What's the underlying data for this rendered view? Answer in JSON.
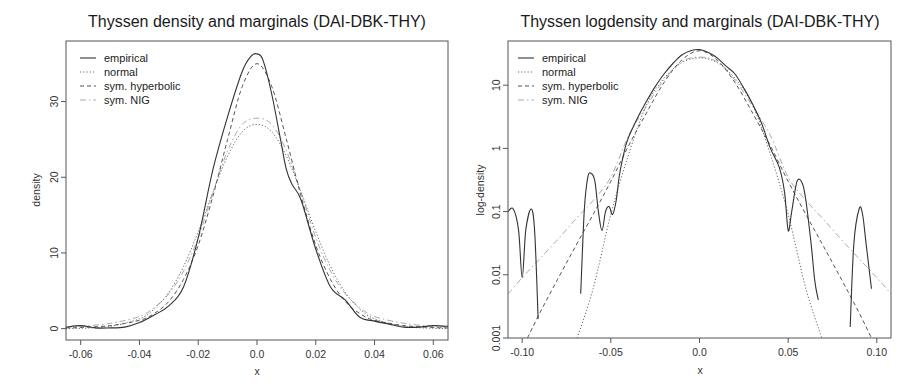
{
  "chart_data": [
    {
      "type": "line",
      "title": "Thyssen density and marginals (DAI-DBK-THY)",
      "xlabel": "x",
      "ylabel": "density",
      "xlim": [
        -0.065,
        0.065
      ],
      "ylim": [
        -1.5,
        38
      ],
      "yscale": "linear",
      "xticks": [
        -0.06,
        -0.04,
        -0.02,
        0.0,
        0.02,
        0.04,
        0.06
      ],
      "xtick_labels": [
        "-0.06",
        "-0.04",
        "-0.02",
        "0.0",
        "0.02",
        "0.04",
        "0.06"
      ],
      "yticks": [
        0,
        10,
        20,
        30
      ],
      "ytick_labels": [
        "0",
        "10",
        "20",
        "30"
      ],
      "legend": {
        "placement": "top-left",
        "entries": [
          "empirical",
          "normal",
          "sym. hyperbolic",
          "sym. NIG"
        ]
      },
      "series": [
        {
          "name": "empirical",
          "style": "solid",
          "color": "#333333",
          "x": [
            -0.065,
            -0.06,
            -0.055,
            -0.05,
            -0.045,
            -0.04,
            -0.035,
            -0.03,
            -0.025,
            -0.02,
            -0.015,
            -0.01,
            -0.005,
            -0.002,
            0.0,
            0.002,
            0.005,
            0.008,
            0.01,
            0.012,
            0.015,
            0.02,
            0.025,
            0.03,
            0.035,
            0.04,
            0.045,
            0.05,
            0.055,
            0.06,
            0.065
          ],
          "y": [
            0.2,
            0.4,
            0.1,
            0.1,
            0.2,
            0.8,
            1.8,
            3.0,
            5.5,
            12,
            21,
            28,
            34,
            36,
            36.3,
            35.5,
            31,
            25,
            21,
            19,
            17,
            10.5,
            5.5,
            3.8,
            1.5,
            1.0,
            0.6,
            0.2,
            0.2,
            0.4,
            0.3
          ]
        },
        {
          "name": "normal",
          "style": "dotted",
          "color": "#666666",
          "x": [
            -0.065,
            -0.06,
            -0.05,
            -0.04,
            -0.035,
            -0.03,
            -0.025,
            -0.02,
            -0.015,
            -0.01,
            -0.005,
            0.0,
            0.005,
            0.01,
            0.015,
            0.02,
            0.025,
            0.03,
            0.035,
            0.04,
            0.05,
            0.06,
            0.065
          ],
          "y": [
            0.02,
            0.05,
            0.3,
            1.3,
            2.6,
            4.8,
            8.2,
            12.8,
            18.0,
            22.8,
            26.0,
            27.0,
            26.0,
            22.8,
            18.0,
            12.8,
            8.2,
            4.8,
            2.6,
            1.3,
            0.3,
            0.05,
            0.02
          ]
        },
        {
          "name": "sym. hyperbolic",
          "style": "dashed",
          "color": "#555555",
          "x": [
            -0.065,
            -0.06,
            -0.05,
            -0.04,
            -0.035,
            -0.03,
            -0.025,
            -0.02,
            -0.015,
            -0.01,
            -0.005,
            0.0,
            0.005,
            0.01,
            0.015,
            0.02,
            0.025,
            0.03,
            0.035,
            0.04,
            0.05,
            0.06,
            0.065
          ],
          "y": [
            0.1,
            0.15,
            0.4,
            1.1,
            2.0,
            3.6,
            6.5,
            11.0,
            17.5,
            25.0,
            32.0,
            35.0,
            32.0,
            25.0,
            17.5,
            11.0,
            6.5,
            3.6,
            2.0,
            1.1,
            0.4,
            0.15,
            0.1
          ]
        },
        {
          "name": "sym. NIG",
          "style": "dashdot",
          "color": "#aaaaaa",
          "x": [
            -0.065,
            -0.06,
            -0.05,
            -0.04,
            -0.035,
            -0.03,
            -0.025,
            -0.02,
            -0.015,
            -0.01,
            -0.005,
            0.0,
            0.005,
            0.01,
            0.015,
            0.02,
            0.025,
            0.03,
            0.035,
            0.04,
            0.05,
            0.06,
            0.065
          ],
          "y": [
            0.2,
            0.3,
            0.7,
            1.6,
            2.8,
            4.6,
            7.6,
            12.0,
            18.0,
            23.5,
            27.0,
            27.8,
            27.0,
            23.5,
            18.0,
            12.0,
            7.6,
            4.6,
            2.8,
            1.6,
            0.7,
            0.3,
            0.2
          ]
        }
      ]
    },
    {
      "type": "line",
      "title": "Thyssen logdensity and marginals (DAI-DBK-THY)",
      "xlabel": "x",
      "ylabel": "log-density",
      "xlim": [
        -0.108,
        0.108
      ],
      "ylim": [
        0.001,
        50
      ],
      "yscale": "log",
      "xticks": [
        -0.1,
        -0.05,
        0.0,
        0.05,
        0.1
      ],
      "xtick_labels": [
        "-0.10",
        "-0.05",
        "0.0",
        "0.05",
        "0.10"
      ],
      "yticks": [
        0.001,
        0.01,
        0.1,
        1,
        10
      ],
      "ytick_labels": [
        "0.001",
        "0.01",
        "0.1",
        "1",
        "10"
      ],
      "legend": {
        "placement": "top-left",
        "entries": [
          "empirical",
          "normal",
          "sym. hyperbolic",
          "sym. NIG"
        ]
      },
      "series": [
        {
          "name": "empirical",
          "style": "solid",
          "color": "#333333",
          "segments": [
            {
              "x": [
                -0.108,
                -0.105,
                -0.102,
                -0.1,
                -0.098,
                -0.095,
                -0.093,
                -0.091
              ],
              "y": [
                0.1,
                0.11,
                0.05,
                0.009,
                0.05,
                0.11,
                0.05,
                0.002
              ]
            },
            {
              "x": [
                -0.067,
                -0.065,
                -0.063,
                -0.061,
                -0.059,
                -0.057,
                -0.055,
                -0.053,
                -0.051,
                -0.049,
                -0.047,
                -0.045,
                -0.042,
                -0.04,
                -0.035,
                -0.03,
                -0.025,
                -0.02,
                -0.015,
                -0.01,
                -0.005,
                0.0,
                0.005,
                0.01,
                0.015,
                0.02,
                0.025,
                0.03,
                0.035,
                0.04,
                0.045,
                0.048,
                0.05,
                0.052,
                0.055,
                0.058,
                0.06,
                0.063,
                0.065,
                0.067
              ],
              "y": [
                0.005,
                0.1,
                0.35,
                0.4,
                0.3,
                0.1,
                0.05,
                0.1,
                0.12,
                0.09,
                0.15,
                0.4,
                1.0,
                1.5,
                3.0,
                5.5,
                9.5,
                15,
                22,
                30,
                35,
                36.5,
                33,
                27,
                20,
                15,
                9,
                5,
                2.5,
                1.0,
                0.5,
                0.2,
                0.05,
                0.1,
                0.3,
                0.28,
                0.15,
                0.03,
                0.008,
                0.004
              ]
            },
            {
              "x": [
                0.085,
                0.087,
                0.09,
                0.092,
                0.094,
                0.097
              ],
              "y": [
                0.0015,
                0.03,
                0.11,
                0.09,
                0.03,
                0.006
              ]
            }
          ]
        },
        {
          "name": "normal",
          "style": "dotted",
          "color": "#666666",
          "x": [
            -0.069,
            -0.06,
            -0.05,
            -0.04,
            -0.03,
            -0.02,
            -0.01,
            0.0,
            0.01,
            0.02,
            0.03,
            0.04,
            0.05,
            0.06,
            0.069
          ],
          "y": [
            0.001,
            0.006,
            0.09,
            0.8,
            4.8,
            12.8,
            22.8,
            27.0,
            22.8,
            12.8,
            4.8,
            0.8,
            0.09,
            0.006,
            0.001
          ]
        },
        {
          "name": "sym. hyperbolic",
          "style": "dashed",
          "color": "#555555",
          "x": [
            -0.097,
            -0.09,
            -0.08,
            -0.07,
            -0.06,
            -0.05,
            -0.04,
            -0.03,
            -0.02,
            -0.01,
            0.0,
            0.01,
            0.02,
            0.03,
            0.04,
            0.05,
            0.06,
            0.07,
            0.08,
            0.09,
            0.097
          ],
          "y": [
            0.001,
            0.0025,
            0.0085,
            0.028,
            0.09,
            0.3,
            1.1,
            3.6,
            11.0,
            25.0,
            35.0,
            25.0,
            11.0,
            3.6,
            1.1,
            0.3,
            0.09,
            0.028,
            0.0085,
            0.0025,
            0.001
          ]
        },
        {
          "name": "sym. NIG",
          "style": "dashdot",
          "color": "#aaaaaa",
          "x": [
            -0.108,
            -0.1,
            -0.09,
            -0.08,
            -0.07,
            -0.06,
            -0.05,
            -0.04,
            -0.03,
            -0.02,
            -0.01,
            0.0,
            0.01,
            0.02,
            0.03,
            0.04,
            0.05,
            0.06,
            0.07,
            0.08,
            0.09,
            0.1,
            0.108
          ],
          "y": [
            0.005,
            0.009,
            0.018,
            0.036,
            0.075,
            0.15,
            0.35,
            1.6,
            4.6,
            12.0,
            23.5,
            27.8,
            23.5,
            12.0,
            4.6,
            1.6,
            0.35,
            0.15,
            0.075,
            0.036,
            0.018,
            0.009,
            0.005
          ]
        }
      ]
    }
  ]
}
